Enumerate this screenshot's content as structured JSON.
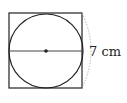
{
  "diagram": {
    "shapes": {
      "square": {
        "x": 9,
        "y": 13,
        "width": 73,
        "height": 75
      },
      "circle": {
        "cx": 46,
        "cy": 51,
        "r": 37
      },
      "diameter": {
        "x1": 9,
        "y1": 51,
        "x2": 82,
        "y2": 51
      },
      "center_point": {
        "cx": 46,
        "cy": 51
      }
    },
    "dimension_label": "7 cm",
    "colors": {
      "stroke": "#222222",
      "dashed_arc": "#aaaaaa",
      "background": "#ffffff"
    }
  }
}
